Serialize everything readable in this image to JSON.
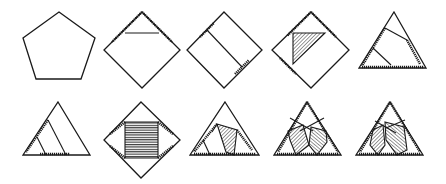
{
  "figure": {
    "rows": [
      {
        "panels": [
          {
            "id": "a",
            "shape": "pentagon"
          },
          {
            "id": "b",
            "shape": "square-rotated",
            "cut": "triangle-top"
          },
          {
            "id": "c",
            "shape": "square-rotated",
            "cut": "parallel-strip"
          },
          {
            "id": "d",
            "shape": "square-rotated",
            "cut": "shaded-triangle"
          },
          {
            "id": "e",
            "shape": "triangle",
            "cut": "two-segments"
          }
        ]
      },
      {
        "panels": [
          {
            "id": "f",
            "shape": "triangle",
            "cut": "two-parallels"
          },
          {
            "id": "g",
            "shape": "square-rotated",
            "cut": "shaded-square"
          },
          {
            "id": "h",
            "shape": "triangle",
            "cut": "shaded-quadrilateral"
          },
          {
            "id": "i",
            "shape": "triangle",
            "cut": "two-shaded-kites"
          },
          {
            "id": "j",
            "shape": "triangle",
            "cut": "shaded-overlap"
          }
        ]
      }
    ],
    "colors": {
      "stroke": "#1a1a1a",
      "background": "#ffffff"
    }
  }
}
